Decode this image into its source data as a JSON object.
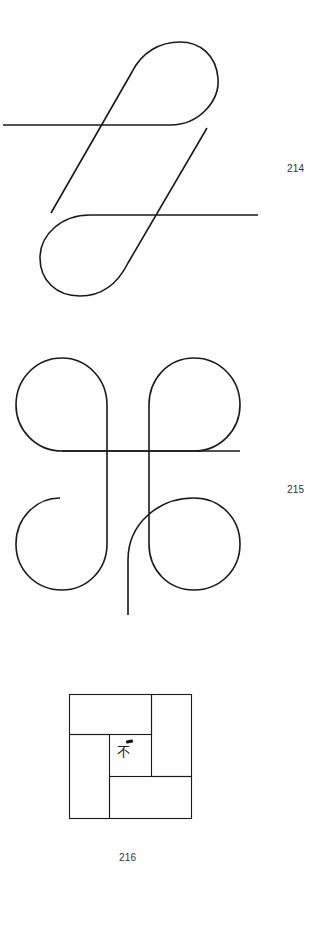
{
  "figures": [
    {
      "number": "214",
      "description": "Two interlocking teardrop loops with crossing diagonal and horizontal strokes"
    },
    {
      "number": "215",
      "description": "Four-lobed knot figure with crossing verticals and horizontal, tail stem at bottom"
    },
    {
      "number": "216",
      "description": "Square divided into four rectangles around a central square containing a small mark"
    }
  ],
  "figure_216_center_mark": "不"
}
